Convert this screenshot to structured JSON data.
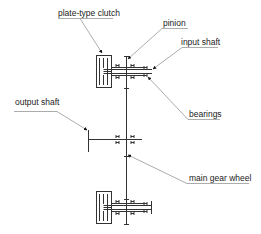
{
  "diagram": {
    "type": "kinematic-schematic",
    "line_color": "#333333",
    "leader_color": "#777777",
    "labels": [
      {
        "id": "plate-type-clutch",
        "text": "plate-type clutch"
      },
      {
        "id": "pinion",
        "text": "pinion"
      },
      {
        "id": "input-shaft",
        "text": "input shaft"
      },
      {
        "id": "output-shaft",
        "text": "output shaft"
      },
      {
        "id": "bearings",
        "text": "bearings"
      },
      {
        "id": "main-gear-wheel",
        "text": "main gear wheel"
      }
    ]
  }
}
